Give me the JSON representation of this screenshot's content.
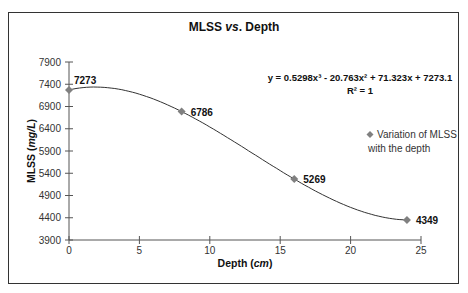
{
  "chart_data": {
    "type": "scatter",
    "title": "MLSS vs. Depth",
    "title_parts": {
      "a": "MLSS ",
      "b": "vs",
      "c": ". Depth"
    },
    "xlabel": "Depth (cm)",
    "xlabel_parts": {
      "a": "Depth (",
      "b": "cm",
      "c": ")"
    },
    "ylabel": "MLSS (mg/L)",
    "ylabel_parts": {
      "a": "MLSS (",
      "b": "mg/L",
      "c": ")"
    },
    "xlim": [
      0,
      25
    ],
    "ylim": [
      3900,
      7900
    ],
    "x_ticks": [
      "0",
      "5",
      "10",
      "15",
      "20",
      "25"
    ],
    "y_ticks": [
      "3900",
      "4400",
      "4900",
      "5400",
      "5900",
      "6400",
      "6900",
      "7400",
      "7900"
    ],
    "grid": false,
    "series": [
      {
        "name": "Variation of MLSS with the depth",
        "x": [
          0,
          8,
          16,
          24
        ],
        "y": [
          7273,
          6786,
          5269,
          4349
        ],
        "labels": [
          "7273",
          "6786",
          "5269",
          "4349"
        ],
        "marker": "diamond",
        "color": "#808080"
      }
    ],
    "trendline": {
      "type": "polynomial",
      "order": 3,
      "equation": "y = 0.5298x³ - 20.763x² + 71.323x + 7273.1",
      "r_squared": "R² = 1",
      "coefficients": [
        0.5298,
        -20.763,
        71.323,
        7273.1
      ],
      "color": "#333333"
    },
    "legend": {
      "position": "right",
      "line1": "Variation of MLSS",
      "line2": "with the depth"
    }
  }
}
